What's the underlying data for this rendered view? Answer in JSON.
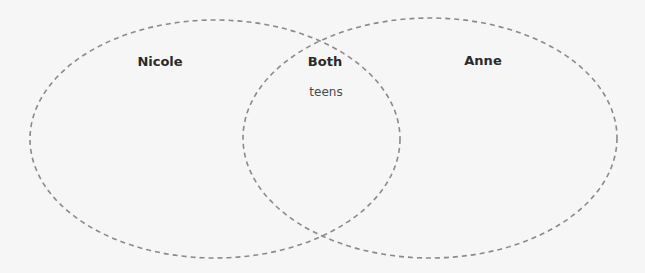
{
  "diagram": {
    "type": "venn",
    "stroke_color": "#8a8a8a",
    "background": "#f6f6f6",
    "sets": [
      {
        "id": "left",
        "label": "Nicole",
        "cx": 215,
        "cy": 139,
        "rx": 185,
        "ry": 119,
        "items": []
      },
      {
        "id": "right",
        "label": "Anne",
        "cx": 430,
        "cy": 138,
        "rx": 187,
        "ry": 120,
        "items": []
      }
    ],
    "intersection": {
      "label": "Both",
      "items": [
        "teens"
      ]
    }
  }
}
